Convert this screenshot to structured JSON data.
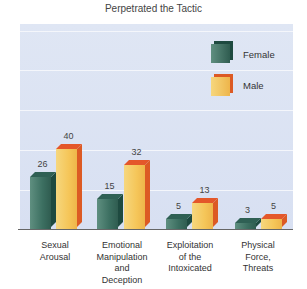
{
  "chart_data": {
    "type": "bar",
    "title": "Perpetrated the Tactic",
    "xlabel": "",
    "ylabel": "",
    "categories": [
      "Sexual Arousal",
      "Emotional Manipulation and Deception",
      "Exploitation of the Intoxicated",
      "Physical Force, Threats"
    ],
    "category_lines": [
      [
        "Sexual",
        "Arousal"
      ],
      [
        "Emotional",
        "Manipulation",
        "and",
        "Deception"
      ],
      [
        "Exploitation",
        "of the",
        "Intoxicated"
      ],
      [
        "Physical",
        "Force,",
        "Threats"
      ]
    ],
    "series": [
      {
        "name": "Female",
        "values": [
          26,
          15,
          5,
          3
        ],
        "color": "#3c6f61"
      },
      {
        "name": "Male",
        "values": [
          40,
          32,
          13,
          5
        ],
        "color": "#f5c659"
      }
    ],
    "ylim": [
      0,
      100
    ],
    "grid": true,
    "gridlines": [
      20,
      40,
      60,
      80,
      100
    ],
    "legend_position": "upper right (inside)",
    "data_labels": true
  },
  "legend": {
    "female": "Female",
    "male": "Male"
  }
}
